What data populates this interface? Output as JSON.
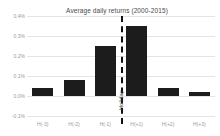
{
  "chart_data": {
    "type": "bar",
    "title": "Average daily returns (2000-2015)",
    "xlabel": "",
    "ylabel": "",
    "categories": [
      "H(-3)",
      "H(-2)",
      "H(-1)",
      "H(+1)",
      "H(+2)",
      "H(+3)"
    ],
    "values": [
      0.04,
      0.08,
      0.25,
      0.35,
      0.04,
      0.02
    ],
    "value_unit": "%",
    "ylim": [
      -0.1,
      0.4
    ],
    "ytick_values": [
      0.4,
      0.3,
      0.2,
      0.1,
      0.0,
      -0.1
    ],
    "ytick_labels": [
      "0.4%",
      "0.3%",
      "0.2%",
      "0.1%",
      "0.0%",
      "-0.1%"
    ],
    "grid": true,
    "legend": false,
    "bar_color": "#1c1c1c",
    "grid_color": "#e4e4e4",
    "annotations": [
      {
        "name": "holiday-divider",
        "label": "Holiday",
        "type": "vertical-dashed-line",
        "between": [
          "H(-1)",
          "H(+1)"
        ],
        "color": "#111111"
      }
    ]
  },
  "chart": {
    "title": "Average daily returns (2000-2015)",
    "holiday_label": "Holiday"
  }
}
